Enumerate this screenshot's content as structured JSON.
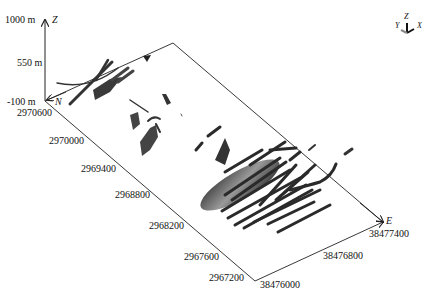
{
  "axes": {
    "z_axis": {
      "name": "Z",
      "ticks": [
        "1000 m",
        "550 m",
        "-100 m"
      ]
    },
    "n_axis": {
      "name": "N",
      "ticks": [
        "2970600",
        "2970000",
        "2969400",
        "2968800",
        "2968200",
        "2967600",
        "2967200"
      ]
    },
    "e_axis": {
      "name": "E",
      "ticks": [
        "38476000",
        "38476800",
        "38477400"
      ]
    }
  },
  "orientation_widget": {
    "labels": [
      "Y",
      "Z",
      "X"
    ]
  },
  "colors": {
    "axis_line": "#222222",
    "ore_body_dark": "#2a2a2a",
    "ore_body_mid": "#777777",
    "background": "#ffffff"
  }
}
